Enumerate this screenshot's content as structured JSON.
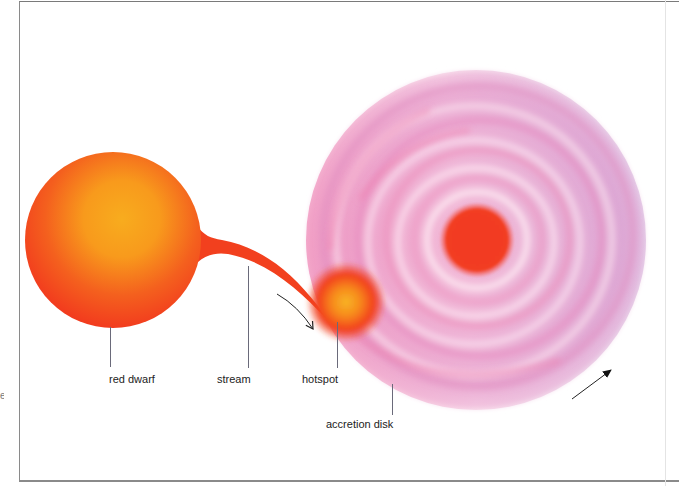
{
  "diagram": {
    "title": "",
    "components": {
      "red_dwarf": {
        "label": "red dwarf",
        "color_core": "#f8a81c",
        "color_edge": "#f2401e"
      },
      "stream": {
        "label": "stream",
        "color": "#f2401e"
      },
      "hotspot": {
        "label": "hotspot",
        "color_core": "#f8b020",
        "color_edge": "#f23a1e"
      },
      "accretion_disk": {
        "label": "accretion disk",
        "color_pink": "#f0a0c8",
        "color_lavender": "#d8a8dc",
        "core_color": "#f23a22"
      }
    },
    "arrows": [
      {
        "name": "stream-flow-arrow",
        "direction": "down-right"
      },
      {
        "name": "disk-rotation-arrow",
        "direction": "up-right"
      }
    ],
    "edge_fragment": "e"
  }
}
